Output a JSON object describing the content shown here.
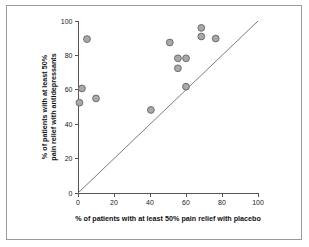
{
  "figure": {
    "frame_color": "#9a9a9a",
    "background_color": "#ffffff"
  },
  "chart_data": {
    "type": "scatter",
    "title": "",
    "xlabel": "% of patients with at least 50% pain relief with placebo",
    "ylabel_line1": "% of patients with at least 50%",
    "ylabel_line2": "pain relief with antidepressants",
    "xlim": [
      0,
      100
    ],
    "ylim": [
      0,
      100
    ],
    "xticks": [
      0,
      20,
      40,
      60,
      80,
      100
    ],
    "yticks": [
      0,
      20,
      40,
      60,
      80,
      100
    ],
    "xticklabels": [
      "0",
      "20",
      "40",
      "60",
      "80",
      "100"
    ],
    "yticklabels": [
      "0",
      "20",
      "40",
      "60",
      "80",
      "100"
    ],
    "grid": false,
    "legend": null,
    "marker_fill_color": "#a8a8a8",
    "marker_edge_color": "#6e6e6e",
    "marker_radius": 3.4,
    "reference_line": {
      "name": "line-of-identity",
      "x": [
        0,
        100
      ],
      "y": [
        0,
        100
      ],
      "color": "#7b7b7b"
    },
    "points": [
      {
        "x": 5.0,
        "y": 89.5
      },
      {
        "x": 2.2,
        "y": 60.8
      },
      {
        "x": 10.0,
        "y": 55.0
      },
      {
        "x": 0.8,
        "y": 52.5
      },
      {
        "x": 40.5,
        "y": 48.3
      },
      {
        "x": 51.0,
        "y": 87.5
      },
      {
        "x": 55.5,
        "y": 78.3
      },
      {
        "x": 60.0,
        "y": 78.3
      },
      {
        "x": 55.5,
        "y": 72.5
      },
      {
        "x": 60.0,
        "y": 61.8
      },
      {
        "x": 68.5,
        "y": 96.0
      },
      {
        "x": 68.5,
        "y": 91.0
      },
      {
        "x": 76.5,
        "y": 89.8
      }
    ]
  }
}
